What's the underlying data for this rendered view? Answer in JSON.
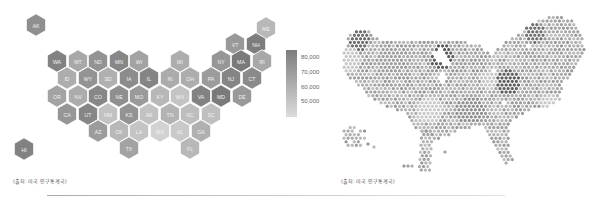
{
  "left_map": {
    "title": "US state hex tile map — median household income",
    "caption": "(출처: 미국 인구통계국)",
    "legend": {
      "labels": [
        "80,000",
        "70,000",
        "60,000",
        "50,000"
      ],
      "color_high": "#7d7d7d",
      "color_low": "#d9d9d9"
    },
    "states": [
      {
        "abbr": "AK",
        "x": 36,
        "y": 25,
        "shade": "#8f8f8f"
      },
      {
        "abbr": "ME",
        "x": 266,
        "y": 28,
        "shade": "#b8b8b8"
      },
      {
        "abbr": "VT",
        "x": 235,
        "y": 44,
        "shade": "#999999"
      },
      {
        "abbr": "NH",
        "x": 256,
        "y": 44,
        "shade": "#7d7d7d"
      },
      {
        "abbr": "WA",
        "x": 57,
        "y": 61,
        "shade": "#828282"
      },
      {
        "abbr": "MT",
        "x": 78,
        "y": 61,
        "shade": "#a8a8a8"
      },
      {
        "abbr": "ND",
        "x": 98,
        "y": 61,
        "shade": "#939393"
      },
      {
        "abbr": "MN",
        "x": 119,
        "y": 61,
        "shade": "#878787"
      },
      {
        "abbr": "WI",
        "x": 139,
        "y": 61,
        "shade": "#a3a3a3"
      },
      {
        "abbr": "MI",
        "x": 180,
        "y": 61,
        "shade": "#adadad"
      },
      {
        "abbr": "NY",
        "x": 221,
        "y": 61,
        "shade": "#969696"
      },
      {
        "abbr": "MA",
        "x": 241,
        "y": 61,
        "shade": "#7a7a7a"
      },
      {
        "abbr": "RI",
        "x": 262,
        "y": 61,
        "shade": "#a8a8a8"
      },
      {
        "abbr": "ID",
        "x": 67,
        "y": 78,
        "shade": "#adadad"
      },
      {
        "abbr": "WY",
        "x": 88,
        "y": 78,
        "shade": "#939393"
      },
      {
        "abbr": "SD",
        "x": 108,
        "y": 78,
        "shade": "#b0b0b0"
      },
      {
        "abbr": "IA",
        "x": 129,
        "y": 78,
        "shade": "#8c8c8c"
      },
      {
        "abbr": "IL",
        "x": 149,
        "y": 78,
        "shade": "#858585"
      },
      {
        "abbr": "IN",
        "x": 170,
        "y": 78,
        "shade": "#ababab"
      },
      {
        "abbr": "OH",
        "x": 190,
        "y": 78,
        "shade": "#adadad"
      },
      {
        "abbr": "PA",
        "x": 211,
        "y": 78,
        "shade": "#9c9c9c"
      },
      {
        "abbr": "NJ",
        "x": 231,
        "y": 78,
        "shade": "#858585"
      },
      {
        "abbr": "CT",
        "x": 252,
        "y": 78,
        "shade": "#8a8a8a"
      },
      {
        "abbr": "OR",
        "x": 57,
        "y": 96,
        "shade": "#a3a3a3"
      },
      {
        "abbr": "NV",
        "x": 78,
        "y": 96,
        "shade": "#acacac"
      },
      {
        "abbr": "CO",
        "x": 98,
        "y": 96,
        "shade": "#878787"
      },
      {
        "abbr": "NE",
        "x": 119,
        "y": 96,
        "shade": "#8f8f8f"
      },
      {
        "abbr": "MO",
        "x": 139,
        "y": 96,
        "shade": "#9a9a9a"
      },
      {
        "abbr": "KY",
        "x": 160,
        "y": 96,
        "shade": "#b8b8b8"
      },
      {
        "abbr": "WV",
        "x": 180,
        "y": 96,
        "shade": "#c4c4c4"
      },
      {
        "abbr": "VA",
        "x": 201,
        "y": 96,
        "shade": "#828282"
      },
      {
        "abbr": "MD",
        "x": 221,
        "y": 96,
        "shade": "#7a7a7a"
      },
      {
        "abbr": "DE",
        "x": 242,
        "y": 96,
        "shade": "#999999"
      },
      {
        "abbr": "CA",
        "x": 67,
        "y": 114,
        "shade": "#969696"
      },
      {
        "abbr": "UT",
        "x": 88,
        "y": 114,
        "shade": "#858585"
      },
      {
        "abbr": "NM",
        "x": 108,
        "y": 114,
        "shade": "#c2c2c2"
      },
      {
        "abbr": "KS",
        "x": 129,
        "y": 114,
        "shade": "#939393"
      },
      {
        "abbr": "AR",
        "x": 149,
        "y": 114,
        "shade": "#c2c2c2"
      },
      {
        "abbr": "TN",
        "x": 170,
        "y": 114,
        "shade": "#b3b3b3"
      },
      {
        "abbr": "NC",
        "x": 190,
        "y": 114,
        "shade": "#bdbdbd"
      },
      {
        "abbr": "SC",
        "x": 211,
        "y": 114,
        "shade": "#bfbfbf"
      },
      {
        "abbr": "AZ",
        "x": 98,
        "y": 131,
        "shade": "#9c9c9c"
      },
      {
        "abbr": "OK",
        "x": 119,
        "y": 131,
        "shade": "#b8b8b8"
      },
      {
        "abbr": "LA",
        "x": 139,
        "y": 131,
        "shade": "#c4c4c4"
      },
      {
        "abbr": "MS",
        "x": 160,
        "y": 131,
        "shade": "#d2d2d2"
      },
      {
        "abbr": "AL",
        "x": 180,
        "y": 131,
        "shade": "#c9c9c9"
      },
      {
        "abbr": "GA",
        "x": 201,
        "y": 131,
        "shade": "#b0b0b0"
      },
      {
        "abbr": "HI",
        "x": 24,
        "y": 149,
        "shade": "#828282"
      },
      {
        "abbr": "TX",
        "x": 129,
        "y": 148,
        "shade": "#a3a3a3"
      },
      {
        "abbr": "FL",
        "x": 190,
        "y": 148,
        "shade": "#b8b8b8"
      }
    ]
  },
  "right_map": {
    "title": "US county-level hex-bin map",
    "caption": "(출처: 미국 인구통계국)"
  }
}
